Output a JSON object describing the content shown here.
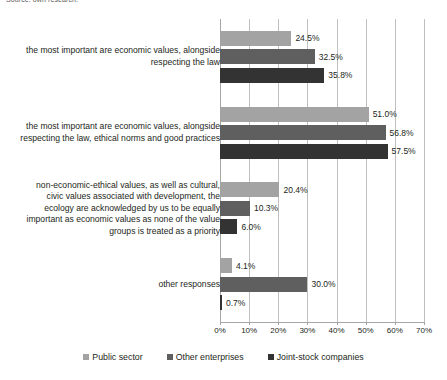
{
  "source_note": "Source: own research.",
  "chart_data": {
    "type": "bar",
    "orientation": "horizontal",
    "title": "",
    "xlabel": "",
    "ylabel": "",
    "xlim": [
      0,
      70
    ],
    "xticks": [
      "0%",
      "10%",
      "20%",
      "30%",
      "40%",
      "50%",
      "60%",
      "70%"
    ],
    "xtick_values": [
      0,
      10,
      20,
      30,
      40,
      50,
      60,
      70
    ],
    "grid": true,
    "legend_position": "bottom",
    "categories": [
      "the most important are economic values, alongside respecting the law",
      "the most important are economic values, alongside respecting the law, ethical norms and good practices",
      "non-economic-ethical values, as well as cultural, civic values associated with development, the ecology are acknowledged by us to be equally important as economic values as none of the value groups is treated as a priority",
      "other responses"
    ],
    "series": [
      {
        "name": "Public sector",
        "color": "#a3a3a3",
        "values": [
          24.5,
          51.0,
          20.4,
          4.1
        ],
        "labels": [
          "24.5%",
          "51.0%",
          "20.4%",
          "4.1%"
        ]
      },
      {
        "name": "Other enterprises",
        "color": "#5f5f5f",
        "values": [
          32.5,
          56.8,
          10.3,
          30.0
        ],
        "labels": [
          "32.5%",
          "56.8%",
          "10.3%",
          "30.0%"
        ]
      },
      {
        "name": "Joint-stock companies",
        "color": "#333333",
        "values": [
          35.8,
          57.5,
          6.0,
          0.7
        ],
        "labels": [
          "35.8%",
          "57.5%",
          "6.0%",
          "0.7%"
        ]
      }
    ]
  }
}
